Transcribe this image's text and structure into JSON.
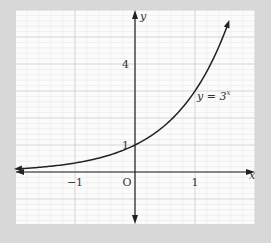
{
  "chart_data": {
    "type": "line",
    "title": "",
    "xlabel": "x",
    "ylabel": "y",
    "function": "y = 3^x",
    "curve_label": "y = 3",
    "curve_label_exponent": "x",
    "origin_label": "O",
    "x_ticks": [
      {
        "value": -1,
        "label": "−1"
      },
      {
        "value": 1,
        "label": "1"
      }
    ],
    "y_ticks": [
      {
        "value": 1,
        "label": "1"
      },
      {
        "value": 4,
        "label": "4"
      }
    ],
    "xlim": [
      -2,
      2
    ],
    "ylim": [
      -2,
      6
    ],
    "grid": true,
    "series": [
      {
        "name": "y = 3^x",
        "x": [
          -2,
          -1.5,
          -1,
          -0.5,
          0,
          0.5,
          1,
          1.3,
          1.6
        ],
        "values": [
          0.11,
          0.19,
          0.33,
          0.58,
          1,
          1.73,
          3,
          4.17,
          5.8
        ]
      }
    ]
  },
  "colors": {
    "background": "#d8d8d8",
    "paper": "#fbfbfb",
    "grid_minor": "#e4e4e4",
    "grid_major": "#cfcfcf",
    "ink": "#222222"
  }
}
